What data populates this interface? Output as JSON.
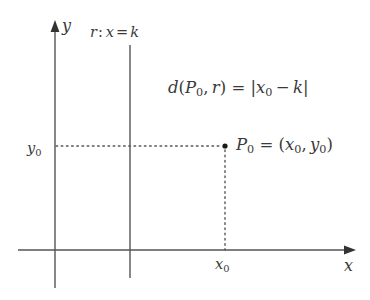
{
  "figure": {
    "kind": "coordinate-plane-diagram",
    "width": 370,
    "height": 300,
    "background_color": "#ffffff",
    "stroke_color": "#555555",
    "text_color": "#3a3a3a"
  },
  "axes": {
    "x_axis": {
      "label": "x",
      "arrow": "right",
      "y_pixel": 250,
      "x_start_pixel": 18,
      "x_end_pixel": 356
    },
    "y_axis": {
      "label": "y",
      "arrow": "up",
      "x_pixel": 55,
      "y_start_pixel": 20,
      "y_end_pixel": 288
    }
  },
  "line_r": {
    "label_name": "r",
    "label_colon": ":",
    "label_equation_lhs": "x",
    "label_equation_op": "=",
    "label_equation_rhs": "k",
    "x_pixel": 130,
    "y_top_pixel": 45,
    "y_bottom_pixel": 278
  },
  "point": {
    "name": "P",
    "name_subscript": "0",
    "equals": "=",
    "open_paren": "(",
    "coord_x": "x",
    "coord_x_subscript": "0",
    "comma": ",",
    "coord_y": "y",
    "coord_y_subscript": "0",
    "close_paren": ")",
    "x_pixel": 225,
    "y_pixel": 146
  },
  "formula": {
    "d": "d",
    "open_paren": "(",
    "point": "P",
    "point_subscript": "0",
    "comma": ",",
    "line": "r",
    "close_paren": ")",
    "equals": "=",
    "abs_open": "|",
    "x0": "x",
    "x0_subscript": "0",
    "minus": "−",
    "k": "k",
    "abs_close": "|"
  },
  "ticks": {
    "y_value": "y",
    "y_value_subscript": "0",
    "x_value": "x",
    "x_value_subscript": "0"
  },
  "guides": {
    "horizontal_dotted": {
      "from_x_pixel": 56,
      "to_x_pixel": 225,
      "y_pixel": 146
    },
    "vertical_dotted": {
      "x_pixel": 225,
      "from_y_pixel": 146,
      "to_y_pixel": 250
    }
  }
}
